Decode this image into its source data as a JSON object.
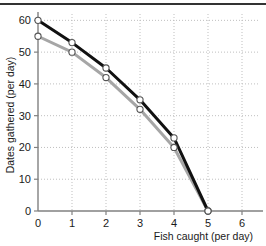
{
  "chart_data": {
    "type": "line",
    "title": "",
    "xlabel": "Fish caught (per day)",
    "ylabel": "Dates gathered (per day)",
    "x": [
      0,
      1,
      2,
      3,
      4,
      5
    ],
    "xlim": [
      0,
      6.5
    ],
    "ylim": [
      0,
      62
    ],
    "xticks": [
      "0",
      "1",
      "2",
      "3",
      "4",
      "5",
      "6"
    ],
    "xtick_values": [
      0,
      1,
      2,
      3,
      4,
      5,
      6
    ],
    "yticks": [
      "0",
      "10",
      "20",
      "30",
      "40",
      "50",
      "60"
    ],
    "ytick_values": [
      0,
      10,
      20,
      30,
      40,
      50,
      60
    ],
    "grid": "dotted",
    "legend": "none",
    "series": [
      {
        "name": "black-curve",
        "color": "#111111",
        "marker": "open-circle",
        "values": [
          60,
          53,
          45,
          35,
          23,
          0
        ]
      },
      {
        "name": "gray-curve",
        "color": "#a6a6a6",
        "marker": "open-circle",
        "values": [
          55,
          50,
          42,
          32,
          20,
          0
        ]
      }
    ]
  },
  "axes": {
    "x_label": "Fish caught (per day)",
    "y_label": "Dates gathered (per day)"
  },
  "colors": {
    "series_black": "#111111",
    "series_gray": "#a6a6a6",
    "axis": "#808080",
    "grid": "#bfbfbf",
    "text": "#1a1a1a",
    "background": "#ffffff",
    "top_rule": "#333333"
  }
}
